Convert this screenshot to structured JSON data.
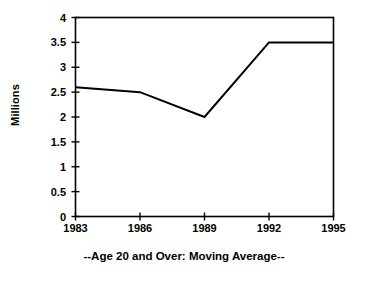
{
  "chart_data": {
    "type": "line",
    "title": "",
    "subtitle": "",
    "xlabel": "--Age 20 and Over: Moving Average--",
    "ylabel": "Millions",
    "categories": [
      "1983",
      "1986",
      "1989",
      "1992",
      "1995"
    ],
    "x": [
      1983,
      1986,
      1989,
      1992,
      1995
    ],
    "values": [
      2.6,
      2.5,
      2.0,
      3.5,
      3.5
    ],
    "series": [
      {
        "name": "Age 20 and Over: Moving Average",
        "values": [
          2.6,
          2.5,
          2.0,
          3.5,
          3.5
        ]
      }
    ],
    "xlim": [
      1983,
      1995
    ],
    "ylim": [
      0,
      4
    ],
    "ytick_labels": [
      "0",
      "0.5",
      "1",
      "1.5",
      "2",
      "2.5",
      "3",
      "3.5",
      "4"
    ],
    "ytick_values": [
      0,
      0.5,
      1,
      1.5,
      2,
      2.5,
      3,
      3.5,
      4
    ],
    "xtick_labels": [
      "1983",
      "1986",
      "1989",
      "1992",
      "1995"
    ],
    "grid": false,
    "legend": false,
    "legend_position": "none",
    "line_color": "#000000",
    "background_color": "#ffffff",
    "frame": true
  },
  "axis": {
    "y_title": "Millions",
    "caption": "--Age 20 and Over: Moving Average--"
  }
}
